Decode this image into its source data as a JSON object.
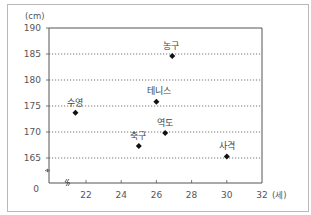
{
  "chart_data": {
    "type": "scatter",
    "title": "",
    "xlabel": "(세)",
    "ylabel": "(cm)",
    "xlim": [
      20,
      32
    ],
    "ylim": [
      160,
      190
    ],
    "x_ticks": [
      22,
      24,
      26,
      28,
      30,
      32
    ],
    "x_tick_labels": [
      "22",
      "24",
      "26",
      "28",
      "30",
      "32"
    ],
    "y_ticks": [
      165,
      170,
      175,
      180,
      185,
      190
    ],
    "y_tick_labels": [
      "165",
      "170",
      "175",
      "180",
      "185",
      "190"
    ],
    "y_origin_label": "0",
    "axis_break": true,
    "grid": "horizontal-dotted",
    "points": [
      {
        "label": "수영",
        "x": 21.4,
        "y": 173.7
      },
      {
        "label": "테니스",
        "x": 26.0,
        "y": 175.8
      },
      {
        "label": "농구",
        "x": 26.9,
        "y": 184.6
      },
      {
        "label": "축구",
        "x": 25.0,
        "y": 167.3
      },
      {
        "label": "역도",
        "x": 26.5,
        "y": 169.8
      },
      {
        "label": "사격",
        "x": 30.0,
        "y": 165.3
      }
    ],
    "colors": {
      "marker": "#111111",
      "axis": "#555555",
      "grid": "#666666"
    }
  }
}
